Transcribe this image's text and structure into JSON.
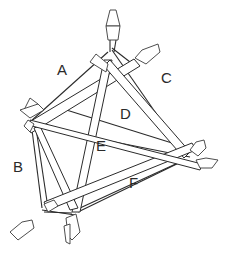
{
  "diagram": {
    "type": "tensegrity-structure-illustration",
    "stroke_color": "#2b2b2b",
    "background": "#ffffff",
    "labels": [
      {
        "id": "A",
        "text": "A",
        "x": 57,
        "y": 62
      },
      {
        "id": "B",
        "text": "B",
        "x": 13,
        "y": 159
      },
      {
        "id": "C",
        "text": "C",
        "x": 161,
        "y": 70
      },
      {
        "id": "D",
        "text": "D",
        "x": 120,
        "y": 106
      },
      {
        "id": "E",
        "text": "E",
        "x": 96,
        "y": 138
      },
      {
        "id": "F",
        "text": "F",
        "x": 129,
        "y": 175
      }
    ]
  }
}
